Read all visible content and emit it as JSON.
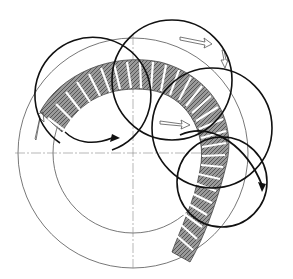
{
  "diagram": {
    "type": "technical-illustration",
    "colors": {
      "background": "#ffffff",
      "ink": "#111111",
      "thin_line": "#555555",
      "hatch": "#777777"
    },
    "ring": {
      "cx": 133,
      "cy": 153,
      "outer_r": 115,
      "inner_r": 80
    },
    "centerlines": {
      "horizontal_y": 153,
      "vertical_x": 133
    },
    "loops": [
      {
        "name": "loop-1",
        "cx": 98,
        "cy": 100,
        "r": 58
      },
      {
        "name": "loop-2",
        "cx": 172,
        "cy": 80,
        "r": 60
      },
      {
        "name": "loop-3",
        "cx": 212,
        "cy": 128,
        "r": 60
      },
      {
        "name": "loop-4",
        "cx": 222,
        "cy": 182,
        "r": 45
      }
    ],
    "labels": []
  }
}
